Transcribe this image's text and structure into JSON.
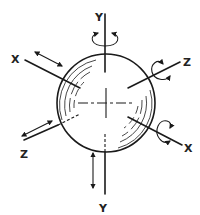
{
  "diagram": {
    "type": "six-degrees-of-freedom sphere",
    "labels": {
      "y_top": "Y",
      "y_bottom": "Y",
      "x_upper_left": "X",
      "x_lower_right": "X",
      "z_upper_right": "Z",
      "z_lower_left": "Z"
    },
    "axes": [
      {
        "name": "Y",
        "motions": [
          "rotation",
          "translation"
        ]
      },
      {
        "name": "X",
        "motions": [
          "translation",
          "rotation"
        ]
      },
      {
        "name": "Z",
        "motions": [
          "rotation",
          "translation"
        ]
      }
    ],
    "colors": {
      "ink": "#1a1a1a",
      "background": "#ffffff"
    }
  }
}
